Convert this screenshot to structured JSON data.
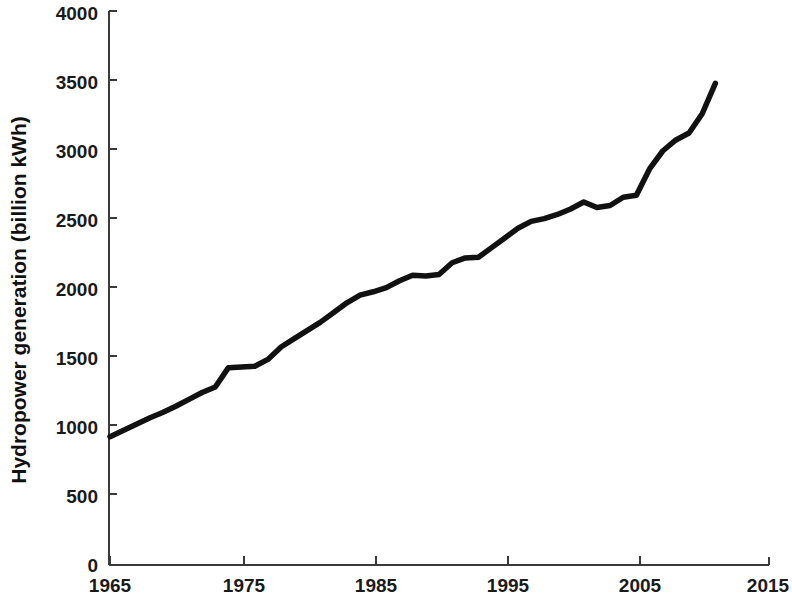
{
  "chart_data": {
    "type": "line",
    "title": "",
    "xlabel": "",
    "ylabel": "Hydropower generation (billion kWh)",
    "xlim": [
      1965,
      2015
    ],
    "ylim": [
      0,
      4000
    ],
    "x_ticks": [
      1965,
      1975,
      1985,
      1995,
      2005,
      2015
    ],
    "y_ticks": [
      0,
      500,
      1000,
      1500,
      2000,
      2500,
      3000,
      3500,
      4000
    ],
    "grid": false,
    "legend": "none",
    "series": [
      {
        "name": "Hydropower generation",
        "x": [
          1965,
          1966,
          1967,
          1968,
          1969,
          1970,
          1971,
          1972,
          1973,
          1974,
          1975,
          1976,
          1977,
          1978,
          1979,
          1980,
          1981,
          1982,
          1983,
          1984,
          1985,
          1986,
          1987,
          1988,
          1989,
          1990,
          1991,
          1992,
          1993,
          1994,
          1995,
          1996,
          1997,
          1998,
          1999,
          2000,
          2001,
          2002,
          2003,
          2004,
          2005,
          2006,
          2007,
          2008,
          2009,
          2010,
          2011
        ],
        "values": [
          930,
          975,
          1020,
          1065,
          1105,
          1150,
          1200,
          1250,
          1290,
          1430,
          1435,
          1440,
          1490,
          1580,
          1640,
          1700,
          1760,
          1830,
          1900,
          1955,
          1980,
          2010,
          2060,
          2100,
          2095,
          2105,
          2190,
          2225,
          2230,
          2300,
          2370,
          2440,
          2490,
          2510,
          2540,
          2580,
          2630,
          2590,
          2605,
          2665,
          2680,
          2870,
          3000,
          3080,
          3130,
          3270,
          3490
        ]
      }
    ]
  },
  "axes": {
    "y_title": "Hydropower generation (billion kWh)",
    "y_tick_labels": [
      "4000",
      "3500",
      "3000",
      "2500",
      "2000",
      "1500",
      "1000",
      "500",
      "0"
    ],
    "x_tick_labels": [
      "1965",
      "1975",
      "1985",
      "1995",
      "2005",
      "2015"
    ]
  },
  "colors": {
    "line": "#111111",
    "axis": "#3a3a3a",
    "text": "#1a1a1a",
    "background": "#ffffff"
  }
}
